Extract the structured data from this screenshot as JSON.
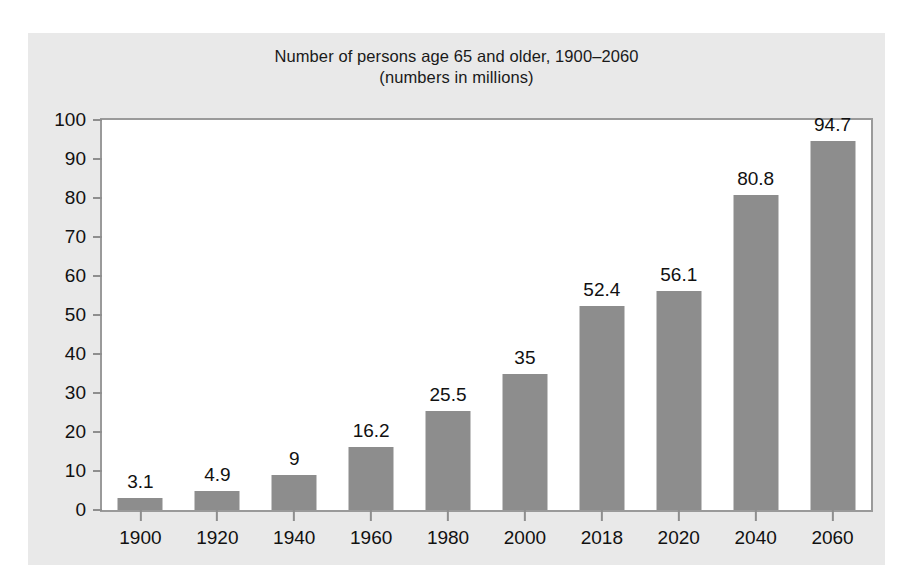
{
  "chart_data": {
    "type": "bar",
    "title": "Number of persons age 65 and older, 1900–2060",
    "subtitle": "(numbers in millions)",
    "xlabel": "",
    "ylabel": "",
    "ylim": [
      0,
      100
    ],
    "ytick_step": 10,
    "yticks": [
      0,
      10,
      20,
      30,
      40,
      50,
      60,
      70,
      80,
      90,
      100
    ],
    "ytick_labels": [
      "0",
      "10",
      "20",
      "30",
      "40",
      "50",
      "60",
      "70",
      "80",
      "90",
      "100"
    ],
    "grid": false,
    "legend": false,
    "legend_position": "none",
    "bar_color": "#8d8d8d",
    "plot_background": "#ffffff",
    "figure_background": "#e9e9e9",
    "categories": [
      "1900",
      "1920",
      "1940",
      "1960",
      "1980",
      "2000",
      "2018",
      "2020",
      "2040",
      "2060"
    ],
    "values": [
      3.1,
      4.9,
      9,
      16.2,
      25.5,
      35,
      52.4,
      56.1,
      80.8,
      94.7
    ],
    "data_labels": [
      "3.1",
      "4.9",
      "9",
      "16.2",
      "25.5",
      "35",
      "52.4",
      "56.1",
      "80.8",
      "94.7"
    ]
  }
}
